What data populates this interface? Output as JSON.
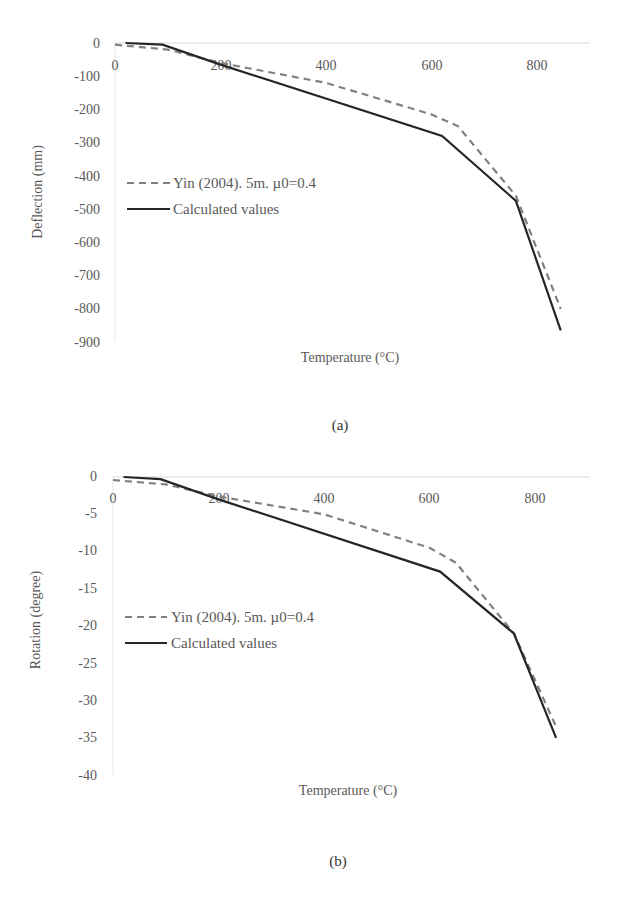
{
  "chart_data": [
    {
      "id": "a",
      "type": "line",
      "title": "",
      "caption": "(a)",
      "xlabel": "Temperature (°C)",
      "ylabel": "Deflection (mm)",
      "xlim": [
        0,
        900
      ],
      "ylim": [
        -900,
        0
      ],
      "x_ticks": [
        "0",
        "200",
        "400",
        "600",
        "800"
      ],
      "y_ticks": [
        "0",
        "-100",
        "-200",
        "-300",
        "-400",
        "-500",
        "-600",
        "-700",
        "-800",
        "-900"
      ],
      "grid": false,
      "legend_position": "left-middle inside plot",
      "series": [
        {
          "name": "Yin (2004). 5m. µ0=0.4",
          "style": "dashed",
          "color": "#808080",
          "x": [
            0,
            100,
            200,
            400,
            600,
            650,
            760,
            845
          ],
          "y": [
            -5,
            -20,
            -60,
            -120,
            -215,
            -250,
            -460,
            -800
          ]
        },
        {
          "name": "Calculated values",
          "style": "solid",
          "color": "#262626",
          "x": [
            20,
            90,
            200,
            620,
            760,
            845
          ],
          "y": [
            0,
            -5,
            -65,
            -280,
            -475,
            -865
          ]
        }
      ]
    },
    {
      "id": "b",
      "type": "line",
      "title": "",
      "caption": "(b)",
      "xlabel": "Temperature (°C)",
      "ylabel": "Rotation (degree)",
      "xlim": [
        0,
        900
      ],
      "ylim": [
        -40,
        0
      ],
      "x_ticks": [
        "0",
        "200",
        "400",
        "600",
        "800"
      ],
      "y_ticks": [
        "0",
        "-5",
        "-10",
        "-15",
        "-20",
        "-25",
        "-30",
        "-35",
        "-40"
      ],
      "grid": false,
      "legend_position": "left-middle inside plot",
      "series": [
        {
          "name": "Yin (2004). 5m. µ0=0.4",
          "style": "dashed",
          "color": "#808080",
          "x": [
            0,
            100,
            200,
            400,
            600,
            650,
            760,
            840
          ],
          "y": [
            -0.4,
            -1.0,
            -2.6,
            -5.0,
            -9.5,
            -11.5,
            -21,
            -33.5
          ]
        },
        {
          "name": "Calculated values",
          "style": "solid",
          "color": "#262626",
          "x": [
            20,
            90,
            200,
            620,
            760,
            840
          ],
          "y": [
            0,
            -0.3,
            -3.0,
            -12.7,
            -21,
            -35
          ]
        }
      ]
    }
  ]
}
